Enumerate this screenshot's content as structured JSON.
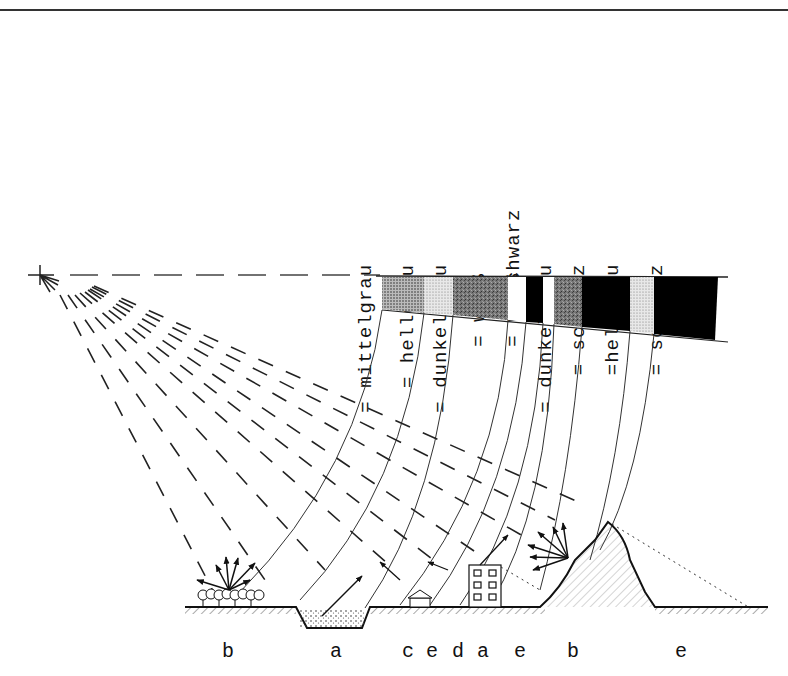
{
  "diagram": {
    "legend_labels": [
      {
        "text": "= mittelgrau",
        "x": 386,
        "bottom": 0
      },
      {
        "text": "= hellgrau",
        "x": 427,
        "bottom": 0
      },
      {
        "text": "= dunkelgrau",
        "x": 459,
        "bottom": 0
      },
      {
        "text": "= weiß",
        "x": 504,
        "bottom": -30
      },
      {
        "text": "= schwarz",
        "x": 525,
        "bottom": 48
      },
      {
        "text": "= weiß",
        "x": 540,
        "bottom": -30
      },
      {
        "text": "= dunkelgrau",
        "x": 563,
        "bottom": 0
      },
      {
        "text": "= schwarz",
        "x": 596,
        "bottom": 0
      },
      {
        "text": "=hellgrau",
        "x": 629,
        "bottom": 0
      },
      {
        "text": "= schwarz",
        "x": 677,
        "bottom": 0
      }
    ],
    "stripe_bar": {
      "segments": [
        {
          "tone": "mittelgrau",
          "color": "#6e6e6e",
          "pattern": "dots"
        },
        {
          "tone": "hellgrau",
          "color": "#c9c9c9",
          "pattern": "dots"
        },
        {
          "tone": "dunkelgrau",
          "color": "#7a7a7a",
          "pattern": "noise"
        },
        {
          "tone": "weiß",
          "color": "#ffffff"
        },
        {
          "tone": "schwarz",
          "color": "#000000"
        },
        {
          "tone": "weiß",
          "color": "#ffffff"
        },
        {
          "tone": "dunkelgrau",
          "color": "#6a6a6a",
          "pattern": "noise"
        },
        {
          "tone": "schwarz",
          "color": "#000000"
        },
        {
          "tone": "hellgrau",
          "color": "#cfcfcf",
          "pattern": "dots"
        },
        {
          "tone": "schwarz",
          "color": "#000000"
        }
      ]
    },
    "ground_labels": [
      {
        "text": "b",
        "x": 222
      },
      {
        "text": "a",
        "x": 330
      },
      {
        "text": "c",
        "x": 402
      },
      {
        "text": "e",
        "x": 426
      },
      {
        "text": "d",
        "x": 452
      },
      {
        "text": "a",
        "x": 477
      },
      {
        "text": "e",
        "x": 514
      },
      {
        "text": "b",
        "x": 567
      },
      {
        "text": "e",
        "x": 675
      }
    ],
    "sensor_icon": "sensor-crosshair-icon",
    "objects": [
      "trees",
      "water-pond",
      "small-house",
      "apartment-building",
      "rocky-hill",
      "shadow-zone"
    ]
  }
}
